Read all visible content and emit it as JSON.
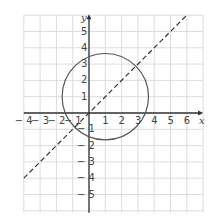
{
  "chart_data": {
    "type": "line",
    "title": "",
    "xlabel": "x",
    "ylabel": "y",
    "xlim": [
      -4,
      7
    ],
    "ylim": [
      -6,
      6
    ],
    "grid": true,
    "x_ticks": [
      "-4",
      "-3",
      "-2",
      "-1",
      "1",
      "2",
      "3",
      "4",
      "5",
      "6"
    ],
    "y_ticks": [
      "5",
      "4",
      "3",
      "2",
      "1",
      "-1",
      "-2",
      "-3",
      "-4",
      "-5"
    ],
    "series": [
      {
        "name": "line y = x",
        "style": "dashed",
        "x": [
          -4,
          6
        ],
        "y": [
          -4,
          6
        ]
      },
      {
        "name": "circle",
        "style": "solid",
        "center": [
          1,
          1
        ],
        "radius": 2.65
      }
    ]
  },
  "axes": {
    "x_label": "x",
    "y_label": "y"
  },
  "colors": {
    "grid": "#dcdcdc",
    "axis": "#333333",
    "curve": "#555555"
  }
}
